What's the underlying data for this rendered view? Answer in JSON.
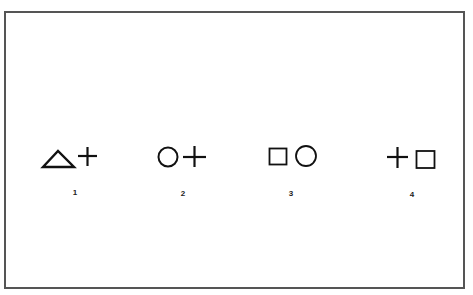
{
  "figure": {
    "border_color": "#555555",
    "stroke_color": "#111111",
    "items": [
      {
        "label": "1",
        "symbols": [
          "triangle",
          "plus"
        ]
      },
      {
        "label": "2",
        "symbols": [
          "circle",
          "plus"
        ]
      },
      {
        "label": "3",
        "symbols": [
          "square",
          "circle"
        ]
      },
      {
        "label": "4",
        "symbols": [
          "plus",
          "square"
        ]
      }
    ]
  }
}
